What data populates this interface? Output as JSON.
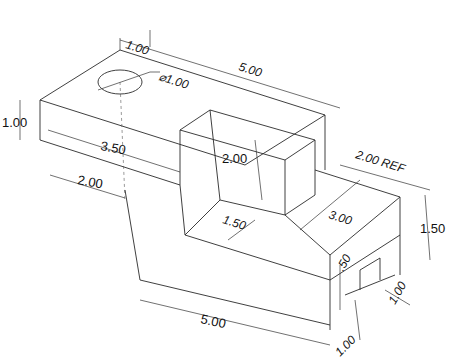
{
  "drawing": {
    "type": "isometric dimensioned part drawing",
    "dimensions": {
      "top_length": "5.00",
      "hole_offset": "1.00",
      "hole_diameter": "⌀1.00",
      "left_height": "1.00",
      "upper_depth": "3.50",
      "lower_depth": "2.00",
      "block_height": "2.00",
      "step_depth": "1.50",
      "ref_width": "2.00 REF",
      "right_length": "3.00",
      "right_height": "1.50",
      "slot_depth": ".50",
      "slot_width": "1.00",
      "bottom_length": "5.00",
      "bottom_right": "1.00"
    }
  }
}
